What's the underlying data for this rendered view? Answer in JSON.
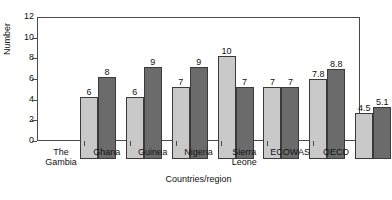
{
  "chart_data": {
    "type": "bar",
    "title": "",
    "xlabel": "Countries/region",
    "ylabel": "Number",
    "ylim": [
      0,
      12
    ],
    "yticks": [
      0,
      2,
      4,
      6,
      8,
      10,
      12
    ],
    "grid": false,
    "legend": "none",
    "categories": [
      "The Gambia",
      "Ghana",
      "Guinea",
      "Nigeria",
      "Sierra\nLeone",
      "ECOWAS",
      "OECD"
    ],
    "series": [
      {
        "name": "series-a",
        "color": "#c9c9c9",
        "values": [
          6,
          6,
          7,
          10,
          7,
          7.8,
          4.5
        ],
        "labels": [
          "6",
          "6",
          "7",
          "10",
          "7",
          "7.8",
          "4.5"
        ]
      },
      {
        "name": "series-b",
        "color": "#6b6b6b",
        "values": [
          8,
          9,
          9,
          7,
          7,
          8.8,
          5.1
        ],
        "labels": [
          "8",
          "9",
          "9",
          "7",
          "7",
          "8.8",
          "5.1"
        ]
      }
    ]
  },
  "colors": {
    "series_a": "#c9c9c9",
    "series_b": "#6b6b6b",
    "axis": "#4a4a4a",
    "text": "#111111",
    "background": "#ffffff"
  }
}
